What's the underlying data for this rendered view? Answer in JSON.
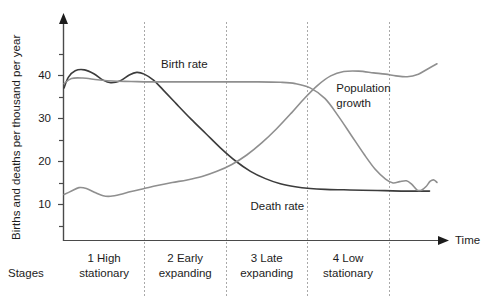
{
  "chart_data": {
    "type": "line",
    "title": "",
    "xlabel": "Time",
    "ylabel": "Births and deaths per thousand per year",
    "ylim": [
      0,
      48
    ],
    "yticks": [
      10,
      20,
      30,
      40
    ],
    "ytick_labels": [
      "10",
      "20",
      "30",
      "40"
    ],
    "minor_yticks": [
      5,
      15,
      25,
      35,
      45
    ],
    "grid": false,
    "legend": "inline-annotations",
    "stage_axis_label": "Stages",
    "stage_boundaries_x": [
      0.0,
      0.215,
      0.435,
      0.652,
      0.871,
      1.0
    ],
    "stages": [
      {
        "number": "1",
        "line1": "1 High",
        "line2": "stationary"
      },
      {
        "number": "2",
        "line1": "2 Early",
        "line2": "expanding"
      },
      {
        "number": "3",
        "line1": "3 Late",
        "line2": "expanding"
      },
      {
        "number": "4",
        "line1": "4 Low",
        "line2": "stationary"
      }
    ],
    "annotations": [
      {
        "name": "birth-rate-label",
        "text": "Birth rate",
        "x": 0.26,
        "y": 42.5
      },
      {
        "name": "death-rate-label",
        "text": "Death rate",
        "x": 0.5,
        "y": 9.5
      },
      {
        "name": "population-growth-label",
        "text": "Population",
        "x": 0.73,
        "y": 37.0
      },
      {
        "name": "population-growth-label-2",
        "text": "growth",
        "x": 0.73,
        "y": 33.5
      }
    ],
    "series": [
      {
        "name": "Death rate",
        "color": "#3c3c3c",
        "width": 1.6,
        "points": [
          [
            0.0,
            37.0
          ],
          [
            0.012,
            39.5
          ],
          [
            0.03,
            41.0
          ],
          [
            0.055,
            41.2
          ],
          [
            0.08,
            40.3
          ],
          [
            0.105,
            38.8
          ],
          [
            0.125,
            38.2
          ],
          [
            0.15,
            38.6
          ],
          [
            0.175,
            40.0
          ],
          [
            0.195,
            40.6
          ],
          [
            0.215,
            40.2
          ],
          [
            0.24,
            38.8
          ],
          [
            0.265,
            36.6
          ],
          [
            0.3,
            33.4
          ],
          [
            0.34,
            29.8
          ],
          [
            0.38,
            26.4
          ],
          [
            0.42,
            23.0
          ],
          [
            0.46,
            20.0
          ],
          [
            0.5,
            17.6
          ],
          [
            0.54,
            15.9
          ],
          [
            0.58,
            14.7
          ],
          [
            0.62,
            14.0
          ],
          [
            0.66,
            13.6
          ],
          [
            0.7,
            13.4
          ],
          [
            0.75,
            13.3
          ],
          [
            0.8,
            13.2
          ],
          [
            0.86,
            13.1
          ],
          [
            0.92,
            13.0
          ],
          [
            0.98,
            13.0
          ]
        ]
      },
      {
        "name": "Birth rate",
        "color": "#8f8f8f",
        "width": 1.6,
        "points": [
          [
            0.0,
            38.0
          ],
          [
            0.02,
            39.2
          ],
          [
            0.05,
            39.3
          ],
          [
            0.09,
            38.9
          ],
          [
            0.13,
            38.6
          ],
          [
            0.18,
            38.5
          ],
          [
            0.23,
            38.4
          ],
          [
            0.3,
            38.4
          ],
          [
            0.38,
            38.4
          ],
          [
            0.45,
            38.4
          ],
          [
            0.52,
            38.4
          ],
          [
            0.58,
            38.3
          ],
          [
            0.62,
            38.0
          ],
          [
            0.66,
            37.0
          ],
          [
            0.7,
            34.5
          ],
          [
            0.735,
            30.5
          ],
          [
            0.77,
            26.0
          ],
          [
            0.805,
            21.5
          ],
          [
            0.835,
            18.0
          ],
          [
            0.862,
            15.8
          ],
          [
            0.882,
            14.9
          ],
          [
            0.9,
            15.2
          ],
          [
            0.918,
            15.4
          ],
          [
            0.932,
            14.6
          ],
          [
            0.946,
            13.3
          ],
          [
            0.958,
            13.2
          ],
          [
            0.97,
            14.0
          ],
          [
            0.982,
            15.3
          ],
          [
            0.992,
            15.6
          ],
          [
            1.0,
            15.0
          ]
        ]
      },
      {
        "name": "Population growth",
        "color": "#8f8f8f",
        "width": 1.6,
        "points": [
          [
            0.0,
            12.2
          ],
          [
            0.02,
            13.0
          ],
          [
            0.04,
            13.8
          ],
          [
            0.06,
            13.6
          ],
          [
            0.085,
            12.6
          ],
          [
            0.105,
            11.9
          ],
          [
            0.125,
            11.8
          ],
          [
            0.15,
            12.2
          ],
          [
            0.18,
            12.9
          ],
          [
            0.215,
            13.6
          ],
          [
            0.25,
            14.3
          ],
          [
            0.29,
            15.0
          ],
          [
            0.33,
            15.6
          ],
          [
            0.37,
            16.4
          ],
          [
            0.41,
            17.6
          ],
          [
            0.45,
            19.2
          ],
          [
            0.49,
            21.4
          ],
          [
            0.53,
            24.2
          ],
          [
            0.57,
            27.5
          ],
          [
            0.61,
            31.2
          ],
          [
            0.645,
            34.6
          ],
          [
            0.68,
            37.6
          ],
          [
            0.715,
            39.8
          ],
          [
            0.75,
            40.8
          ],
          [
            0.79,
            40.9
          ],
          [
            0.83,
            40.5
          ],
          [
            0.862,
            40.2
          ],
          [
            0.89,
            39.8
          ],
          [
            0.92,
            39.6
          ],
          [
            0.95,
            40.2
          ],
          [
            0.975,
            41.4
          ],
          [
            1.0,
            42.6
          ]
        ]
      }
    ]
  },
  "axes": {
    "y_arrow": true,
    "x_arrow": true,
    "time_label": "Time"
  }
}
